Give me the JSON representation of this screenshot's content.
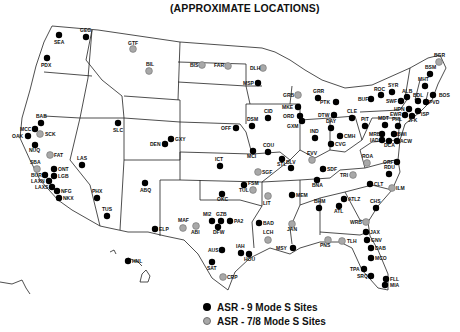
{
  "title": "(APPROXIMATE LOCATIONS)",
  "colors": {
    "asr9": "#000000",
    "asr78": "#a8a8a8",
    "asr78_stroke": "#707070",
    "border": "#222222"
  },
  "legend": [
    {
      "key": "asr9",
      "label": "ASR - 9 Mode S Sites"
    },
    {
      "key": "asr78",
      "label": "ASR - 7/8 Mode S Sites"
    }
  ],
  "sites": [
    {
      "code": "SEA",
      "type": "asr9",
      "x": 59,
      "y": 35,
      "lx": 54,
      "ly": 44
    },
    {
      "code": "GEG",
      "type": "asr9",
      "x": 86,
      "y": 37,
      "lx": 80,
      "ly": 32
    },
    {
      "code": "PDX",
      "type": "asr9",
      "x": 47,
      "y": 58,
      "lx": 41,
      "ly": 67
    },
    {
      "code": "GTF",
      "type": "asr78",
      "x": 133,
      "y": 49,
      "lx": 128,
      "ly": 45
    },
    {
      "code": "BIL",
      "type": "asr78",
      "x": 149,
      "y": 71,
      "lx": 146,
      "ly": 66
    },
    {
      "code": "BIS",
      "type": "asr78",
      "x": 202,
      "y": 65,
      "lx": 190,
      "ly": 67
    },
    {
      "code": "FAR",
      "type": "asr78",
      "x": 228,
      "y": 66,
      "lx": 214,
      "ly": 67
    },
    {
      "code": "DLH",
      "type": "asr78",
      "x": 263,
      "y": 68,
      "lx": 250,
      "ly": 70
    },
    {
      "code": "MSP",
      "type": "asr9",
      "x": 258,
      "y": 83,
      "lx": 243,
      "ly": 85
    },
    {
      "code": "GRB",
      "type": "asr78",
      "x": 298,
      "y": 95,
      "lx": 283,
      "ly": 97
    },
    {
      "code": "GRR",
      "type": "asr9",
      "x": 318,
      "y": 98,
      "lx": 313,
      "ly": 93
    },
    {
      "code": "PTK",
      "type": "asr9",
      "x": 336,
      "y": 102,
      "lx": 320,
      "ly": 104
    },
    {
      "code": "MKE",
      "type": "asr9",
      "x": 298,
      "y": 107,
      "lx": 282,
      "ly": 109
    },
    {
      "code": "ORD",
      "type": "asr9",
      "x": 300,
      "y": 116,
      "lx": 283,
      "ly": 118
    },
    {
      "code": "GXM",
      "type": "asr9",
      "x": 302,
      "y": 121,
      "lx": 287,
      "ly": 128
    },
    {
      "code": "DTW",
      "type": "asr9",
      "x": 334,
      "y": 115,
      "lx": 318,
      "ly": 117
    },
    {
      "code": "CLE",
      "type": "asr9",
      "x": 352,
      "y": 118,
      "lx": 347,
      "ly": 113
    },
    {
      "code": "BGR",
      "type": "asr78",
      "x": 439,
      "y": 62,
      "lx": 434,
      "ly": 57
    },
    {
      "code": "BSM",
      "type": "asr9",
      "x": 430,
      "y": 74,
      "lx": 425,
      "ly": 69
    },
    {
      "code": "MHT",
      "type": "asr9",
      "x": 425,
      "y": 86,
      "lx": 418,
      "ly": 81
    },
    {
      "code": "BOS",
      "type": "asr9",
      "x": 433,
      "y": 95,
      "lx": 439,
      "ly": 97
    },
    {
      "code": "SYR",
      "type": "asr9",
      "x": 392,
      "y": 92,
      "lx": 388,
      "ly": 87
    },
    {
      "code": "ROC",
      "type": "asr9",
      "x": 381,
      "y": 95,
      "lx": 374,
      "ly": 91
    },
    {
      "code": "ALB",
      "type": "asr9",
      "x": 407,
      "y": 97,
      "lx": 402,
      "ly": 93
    },
    {
      "code": "BUF",
      "type": "asr9",
      "x": 371,
      "y": 99,
      "lx": 358,
      "ly": 101
    },
    {
      "code": "SWF",
      "type": "asr9",
      "x": 401,
      "y": 101,
      "lx": 386,
      "ly": 103
    },
    {
      "code": "BDL",
      "type": "asr9",
      "x": 418,
      "y": 101,
      "lx": 413,
      "ly": 97
    },
    {
      "code": "PVD",
      "type": "asr9",
      "x": 426,
      "y": 102,
      "lx": 429,
      "ly": 104
    },
    {
      "code": "HPN",
      "type": "asr9",
      "x": 409,
      "y": 109,
      "lx": 394,
      "ly": 111
    },
    {
      "code": "ISP",
      "type": "asr9",
      "x": 418,
      "y": 111,
      "lx": 421,
      "ly": 116
    },
    {
      "code": "EWR",
      "type": "asr9",
      "x": 405,
      "y": 115,
      "lx": 390,
      "ly": 116
    },
    {
      "code": "JFK",
      "type": "asr9",
      "x": 412,
      "y": 116,
      "lx": 408,
      "ly": 122
    },
    {
      "code": "PIT",
      "type": "asr9",
      "x": 365,
      "y": 126,
      "lx": 361,
      "ly": 121
    },
    {
      "code": "MDT",
      "type": "asr9",
      "x": 385,
      "y": 125,
      "lx": 378,
      "ly": 120
    },
    {
      "code": "PHL",
      "type": "asr9",
      "x": 398,
      "y": 126,
      "lx": 392,
      "ly": 121
    },
    {
      "code": "MRB",
      "type": "asr9",
      "x": 382,
      "y": 134,
      "lx": 369,
      "ly": 136
    },
    {
      "code": "BWI",
      "type": "asr9",
      "x": 394,
      "y": 134,
      "lx": 397,
      "ly": 136
    },
    {
      "code": "IAD",
      "type": "asr9",
      "x": 382,
      "y": 140,
      "lx": 370,
      "ly": 142
    },
    {
      "code": "DCA",
      "type": "asr9",
      "x": 389,
      "y": 141,
      "lx": 384,
      "ly": 147
    },
    {
      "code": "ACW",
      "type": "asr9",
      "x": 397,
      "y": 141,
      "lx": 400,
      "ly": 143
    },
    {
      "code": "ROA",
      "type": "asr78",
      "x": 367,
      "y": 163,
      "lx": 362,
      "ly": 158
    },
    {
      "code": "ORF",
      "type": "asr9",
      "x": 397,
      "y": 162,
      "lx": 383,
      "ly": 164
    },
    {
      "code": "RDU",
      "type": "asr9",
      "x": 389,
      "y": 174,
      "lx": 384,
      "ly": 169
    },
    {
      "code": "TRI",
      "type": "asr78",
      "x": 353,
      "y": 175,
      "lx": 340,
      "ly": 177
    },
    {
      "code": "CLT",
      "type": "asr9",
      "x": 370,
      "y": 184,
      "lx": 374,
      "ly": 186
    },
    {
      "code": "ILM",
      "type": "asr78",
      "x": 392,
      "y": 188,
      "lx": 396,
      "ly": 190
    },
    {
      "code": "DSM",
      "type": "asr9",
      "x": 252,
      "y": 126,
      "lx": 247,
      "ly": 121
    },
    {
      "code": "CID",
      "type": "asr9",
      "x": 268,
      "y": 118,
      "lx": 264,
      "ly": 113
    },
    {
      "code": "OFF",
      "type": "asr9",
      "x": 236,
      "y": 128,
      "lx": 221,
      "ly": 130
    },
    {
      "code": "MCI",
      "type": "asr9",
      "x": 253,
      "y": 151,
      "lx": 247,
      "ly": 158
    },
    {
      "code": "COU",
      "type": "asr9",
      "x": 268,
      "y": 152,
      "lx": 263,
      "ly": 147
    },
    {
      "code": "STL",
      "type": "asr9",
      "x": 282,
      "y": 159,
      "lx": 277,
      "ly": 166
    },
    {
      "code": "BLV",
      "type": "asr9",
      "x": 291,
      "y": 168,
      "lx": 286,
      "ly": 164
    },
    {
      "code": "IND",
      "type": "asr9",
      "x": 315,
      "y": 138,
      "lx": 310,
      "ly": 133
    },
    {
      "code": "DAY",
      "type": "asr9",
      "x": 331,
      "y": 128,
      "lx": 326,
      "ly": 123
    },
    {
      "code": "CMH",
      "type": "asr9",
      "x": 340,
      "y": 136,
      "lx": 344,
      "ly": 138
    },
    {
      "code": "CVG",
      "type": "asr9",
      "x": 331,
      "y": 144,
      "lx": 335,
      "ly": 146
    },
    {
      "code": "EVV",
      "type": "asr78",
      "x": 312,
      "y": 160,
      "lx": 307,
      "ly": 155
    },
    {
      "code": "SDF",
      "type": "asr9",
      "x": 323,
      "y": 169,
      "lx": 327,
      "ly": 171
    },
    {
      "code": "BNA",
      "type": "asr9",
      "x": 317,
      "y": 180,
      "lx": 312,
      "ly": 187
    },
    {
      "code": "MEM",
      "type": "asr9",
      "x": 292,
      "y": 195,
      "lx": 296,
      "ly": 197
    },
    {
      "code": "BHM",
      "type": "asr9",
      "x": 319,
      "y": 208,
      "lx": 314,
      "ly": 203
    },
    {
      "code": "ATLZ",
      "type": "asr9",
      "x": 344,
      "y": 199,
      "lx": 348,
      "ly": 201
    },
    {
      "code": "ATL",
      "type": "asr9",
      "x": 339,
      "y": 206,
      "lx": 334,
      "ly": 213
    },
    {
      "code": "CHS",
      "type": "asr9",
      "x": 376,
      "y": 208,
      "lx": 370,
      "ly": 203
    },
    {
      "code": "WRB",
      "type": "asr78",
      "x": 366,
      "y": 222,
      "lx": 350,
      "ly": 224
    },
    {
      "code": "JAX",
      "type": "asr9",
      "x": 366,
      "y": 232,
      "lx": 370,
      "ly": 234
    },
    {
      "code": "GNV",
      "type": "asr9",
      "x": 367,
      "y": 240,
      "lx": 371,
      "ly": 242
    },
    {
      "code": "DAB",
      "type": "asr9",
      "x": 371,
      "y": 248,
      "lx": 375,
      "ly": 250
    },
    {
      "code": "MCO",
      "type": "asr9",
      "x": 371,
      "y": 258,
      "lx": 375,
      "ly": 260
    },
    {
      "code": "TPA",
      "type": "asr9",
      "x": 364,
      "y": 269,
      "lx": 350,
      "ly": 271
    },
    {
      "code": "SRQ",
      "type": "asr9",
      "x": 371,
      "y": 276,
      "lx": 357,
      "ly": 278
    },
    {
      "code": "FLL",
      "type": "asr9",
      "x": 386,
      "y": 279,
      "lx": 390,
      "ly": 281
    },
    {
      "code": "MIA",
      "type": "asr9",
      "x": 385,
      "y": 285,
      "lx": 390,
      "ly": 287
    },
    {
      "code": "PNS",
      "type": "asr78",
      "x": 328,
      "y": 240,
      "lx": 320,
      "ly": 247
    },
    {
      "code": "TLH",
      "type": "asr78",
      "x": 342,
      "y": 241,
      "lx": 347,
      "ly": 243
    },
    {
      "code": "BAB",
      "type": "asr9",
      "x": 41,
      "y": 123,
      "lx": 36,
      "ly": 118
    },
    {
      "code": "MCC",
      "type": "asr9",
      "x": 35,
      "y": 129,
      "lx": 20,
      "ly": 131
    },
    {
      "code": "SCK",
      "type": "asr78",
      "x": 40,
      "y": 134,
      "lx": 45,
      "ly": 136
    },
    {
      "code": "OAK",
      "type": "asr9",
      "x": 28,
      "y": 136,
      "lx": 12,
      "ly": 138
    },
    {
      "code": "NUQ",
      "type": "asr9",
      "x": 35,
      "y": 145,
      "lx": 29,
      "ly": 152
    },
    {
      "code": "FAT",
      "type": "asr78",
      "x": 50,
      "y": 155,
      "lx": 54,
      "ly": 157
    },
    {
      "code": "SBA",
      "type": "asr78",
      "x": 37,
      "y": 169,
      "lx": 30,
      "ly": 164
    },
    {
      "code": "ONT",
      "type": "asr9",
      "x": 54,
      "y": 169,
      "lx": 58,
      "ly": 171
    },
    {
      "code": "BUR",
      "type": "asr9",
      "x": 45,
      "y": 175,
      "lx": 31,
      "ly": 177
    },
    {
      "code": "LGB",
      "type": "asr9",
      "x": 54,
      "y": 176,
      "lx": 58,
      "ly": 178
    },
    {
      "code": "LAXN",
      "type": "asr9",
      "x": 49,
      "y": 181,
      "lx": 31,
      "ly": 183
    },
    {
      "code": "LAXS",
      "type": "asr9",
      "x": 52,
      "y": 187,
      "lx": 35,
      "ly": 189
    },
    {
      "code": "NFG",
      "type": "asr9",
      "x": 57,
      "y": 191,
      "lx": 61,
      "ly": 193
    },
    {
      "code": "NKX",
      "type": "asr9",
      "x": 59,
      "y": 198,
      "lx": 63,
      "ly": 200
    },
    {
      "code": "LAS",
      "type": "asr9",
      "x": 82,
      "y": 165,
      "lx": 77,
      "ly": 160
    },
    {
      "code": "SLC",
      "type": "asr9",
      "x": 118,
      "y": 123,
      "lx": 113,
      "ly": 132
    },
    {
      "code": "DEN",
      "type": "asr9",
      "x": 165,
      "y": 144,
      "lx": 150,
      "ly": 146
    },
    {
      "code": "GXY",
      "type": "asr9",
      "x": 171,
      "y": 139,
      "lx": 175,
      "ly": 141
    },
    {
      "code": "PHX",
      "type": "asr9",
      "x": 97,
      "y": 198,
      "lx": 92,
      "ly": 193
    },
    {
      "code": "TUS",
      "type": "asr9",
      "x": 107,
      "y": 216,
      "lx": 102,
      "ly": 211
    },
    {
      "code": "ABQ",
      "type": "asr9",
      "x": 145,
      "y": 183,
      "lx": 140,
      "ly": 192
    },
    {
      "code": "ELP",
      "type": "asr9",
      "x": 155,
      "y": 229,
      "lx": 159,
      "ly": 231
    },
    {
      "code": "ICT",
      "type": "asr9",
      "x": 220,
      "y": 166,
      "lx": 215,
      "ly": 161
    },
    {
      "code": "TUL",
      "type": "asr9",
      "x": 244,
      "y": 185,
      "lx": 239,
      "ly": 192
    },
    {
      "code": "OKC",
      "type": "asr9",
      "x": 222,
      "y": 194,
      "lx": 217,
      "ly": 201
    },
    {
      "code": "SGF",
      "type": "asr78",
      "x": 258,
      "y": 172,
      "lx": 262,
      "ly": 174
    },
    {
      "code": "FSM",
      "type": "asr78",
      "x": 253,
      "y": 190,
      "lx": 248,
      "ly": 185
    },
    {
      "code": "LIT",
      "type": "asr78",
      "x": 268,
      "y": 196,
      "lx": 263,
      "ly": 205
    },
    {
      "code": "MAF",
      "type": "asr78",
      "x": 183,
      "y": 228,
      "lx": 178,
      "ly": 222
    },
    {
      "code": "ABI",
      "type": "asr78",
      "x": 196,
      "y": 226,
      "lx": 191,
      "ly": 234
    },
    {
      "code": "MI2",
      "type": "asr9",
      "x": 212,
      "y": 221,
      "lx": 203,
      "ly": 216
    },
    {
      "code": "GZB",
      "type": "asr9",
      "x": 221,
      "y": 221,
      "lx": 216,
      "ly": 216
    },
    {
      "code": "PA2",
      "type": "asr9",
      "x": 230,
      "y": 221,
      "lx": 234,
      "ly": 223
    },
    {
      "code": "DFW",
      "type": "asr9",
      "x": 218,
      "y": 227,
      "lx": 213,
      "ly": 234
    },
    {
      "code": "BAD",
      "type": "asr9",
      "x": 259,
      "y": 223,
      "lx": 263,
      "ly": 225
    },
    {
      "code": "JAN",
      "type": "asr78",
      "x": 292,
      "y": 224,
      "lx": 287,
      "ly": 231
    },
    {
      "code": "LCH",
      "type": "asr78",
      "x": 268,
      "y": 240,
      "lx": 263,
      "ly": 234
    },
    {
      "code": "MSY",
      "type": "asr9",
      "x": 293,
      "y": 248,
      "lx": 276,
      "ly": 250
    },
    {
      "code": "AUS",
      "type": "asr9",
      "x": 222,
      "y": 250,
      "lx": 208,
      "ly": 252
    },
    {
      "code": "IAH",
      "type": "asr9",
      "x": 241,
      "y": 253,
      "lx": 236,
      "ly": 248
    },
    {
      "code": "HOU",
      "type": "asr9",
      "x": 249,
      "y": 254,
      "lx": 244,
      "ly": 261
    },
    {
      "code": "SAT",
      "type": "asr9",
      "x": 212,
      "y": 262,
      "lx": 207,
      "ly": 270
    },
    {
      "code": "CRP",
      "type": "asr78",
      "x": 223,
      "y": 277,
      "lx": 227,
      "ly": 279
    },
    {
      "code": "HNL",
      "type": "asr9",
      "x": 128,
      "y": 261,
      "lx": 132,
      "ly": 263
    }
  ]
}
